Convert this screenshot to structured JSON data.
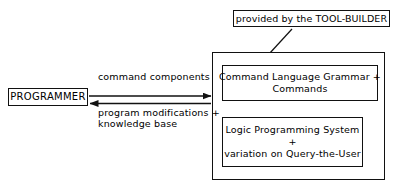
{
  "diagram": {
    "colors": {
      "stroke": "#111111",
      "background": "#ffffff",
      "text": "#000000"
    },
    "nodes": {
      "tool_builder": {
        "label": "provided by the TOOL-BUILDER"
      },
      "programmer": {
        "label": "PROGRAMMER"
      },
      "grammar": {
        "line1": "Command Language Grammar +",
        "line2": "Commands"
      },
      "logic": {
        "line1": "Logic Programming System",
        "line2": "+",
        "line3": "variation on Query-the-User"
      },
      "outer_system": {
        "label": ""
      }
    },
    "edges": {
      "command_components": {
        "label": "command components",
        "direction": "programmer-to-system"
      },
      "program_modifications": {
        "line1": "program modifications +",
        "line2": "knowledge base",
        "direction": "system-to-programmer"
      },
      "tool_builder_arrow": {
        "label": "",
        "direction": "tool-builder-to-grammar"
      }
    }
  }
}
